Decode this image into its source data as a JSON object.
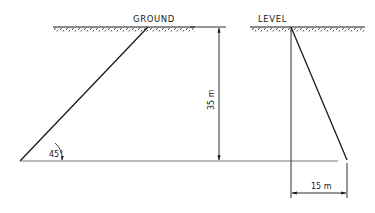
{
  "diagram": {
    "labels": {
      "ground": "GROUND",
      "level": "LEVEL",
      "depth": "35 m",
      "offset": "15 m",
      "angle": "45°"
    },
    "elements": {
      "left_slope_angle_deg": 45,
      "depth_m": 35,
      "right_offset_m": 15
    },
    "colors": {
      "line": "#1a1a1a",
      "baseline": "#555555",
      "background": "#ffffff"
    }
  }
}
